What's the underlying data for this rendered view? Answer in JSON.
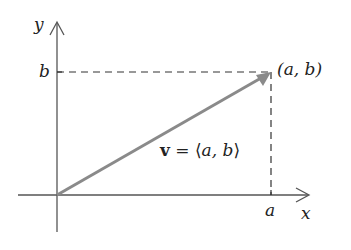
{
  "diagram": {
    "type": "vector-in-plane",
    "colors": {
      "axis": "#555555",
      "vector": "#8a8a8a",
      "dashed": "#333333",
      "text": "#222222"
    },
    "axes": {
      "x_label": "x",
      "y_label": "y"
    },
    "ticks": {
      "x_tick_label": "a",
      "y_tick_label": "b"
    },
    "point": {
      "label": "(a, b)"
    },
    "vector": {
      "name": "v",
      "equals": "=",
      "open_bracket": "⟨",
      "components": "a, b",
      "close_bracket": "⟩"
    }
  }
}
